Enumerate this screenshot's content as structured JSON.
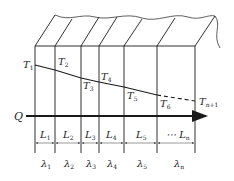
{
  "diagram": {
    "type": "multilayer-wall-heat-conduction",
    "heat_flow_label": "Q",
    "temperatures": [
      {
        "base": "T",
        "sub": "1"
      },
      {
        "base": "T",
        "sub": "2"
      },
      {
        "base": "T",
        "sub": "3"
      },
      {
        "base": "T",
        "sub": "4"
      },
      {
        "base": "T",
        "sub": "5"
      },
      {
        "base": "T",
        "sub": "6"
      },
      {
        "base": "T",
        "sub": "n+1"
      }
    ],
    "thicknesses": [
      {
        "base": "L",
        "sub": "1"
      },
      {
        "base": "L",
        "sub": "2"
      },
      {
        "base": "L",
        "sub": "3"
      },
      {
        "base": "L",
        "sub": "4"
      },
      {
        "base": "L",
        "sub": "5"
      },
      {
        "base": "⋯ L",
        "sub": "n"
      }
    ],
    "conductivities": [
      {
        "base": "λ",
        "sub": "1"
      },
      {
        "base": "λ",
        "sub": "2"
      },
      {
        "base": "λ",
        "sub": "3"
      },
      {
        "base": "λ",
        "sub": "4"
      },
      {
        "base": "λ",
        "sub": "5"
      },
      {
        "base": "λ",
        "sub": "n"
      }
    ],
    "line_color": "#1a1a1a"
  }
}
